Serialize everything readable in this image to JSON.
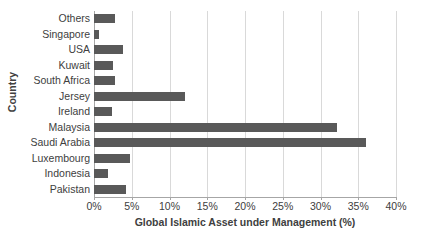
{
  "chart_data": {
    "type": "bar",
    "orientation": "horizontal",
    "title": "",
    "xlabel": "Global Islamic Asset under Management (%)",
    "ylabel": "Country",
    "categories": [
      "Others",
      "Singapore",
      "USA",
      "Kuwait",
      "South Africa",
      "Jersey",
      "Ireland",
      "Malaysia",
      "Saudi Arabia",
      "Luxembourg",
      "Indonesia",
      "Pakistan"
    ],
    "values": [
      2.8,
      0.7,
      3.9,
      2.5,
      2.8,
      12.0,
      2.4,
      32.2,
      36.0,
      4.8,
      1.9,
      4.2
    ],
    "xlim": [
      0,
      40
    ],
    "xtick_values": [
      0,
      5,
      10,
      15,
      20,
      25,
      30,
      35,
      40
    ],
    "xtick_labels": [
      "0%",
      "5%",
      "10%",
      "15%",
      "20%",
      "25%",
      "30%",
      "35%",
      "40%"
    ],
    "grid": "vertical",
    "legend": "none",
    "bar_color": "#595959",
    "gridline_color": "#d9d9d9",
    "axis_color": "#a6a6a6",
    "text_color": "#404040"
  }
}
